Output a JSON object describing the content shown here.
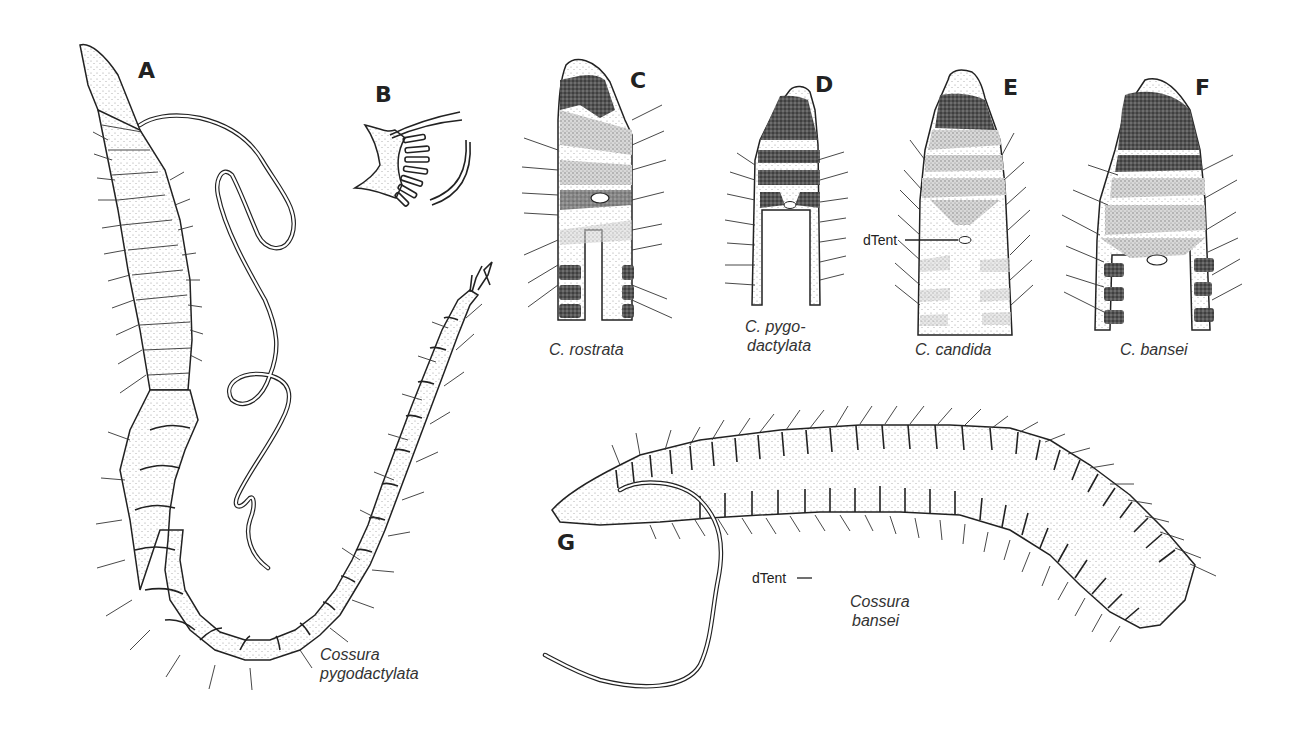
{
  "figure": {
    "panels": [
      {
        "id": "A",
        "label": "A",
        "caption_line1": "Cossura",
        "caption_line2": "pygodactylata",
        "view": "whole worm, dorsal, with dorsal tentacle"
      },
      {
        "id": "B",
        "label": "B",
        "caption": "",
        "view": "pygidium detail with anal cirri"
      },
      {
        "id": "C",
        "label": "C",
        "caption": "C. rostrata",
        "view": "anterior end, dorsal pigmentation"
      },
      {
        "id": "D",
        "label": "D",
        "caption_line1": "C. pygo-",
        "caption_line2": "dactylata",
        "view": "anterior end, dorsal pigmentation"
      },
      {
        "id": "E",
        "label": "E",
        "caption": "C. candida",
        "view": "anterior end, dorsal pigmentation"
      },
      {
        "id": "F",
        "label": "F",
        "caption": "C. bansei",
        "view": "anterior end, dorsal pigmentation"
      },
      {
        "id": "G",
        "label": "G",
        "caption_line1": "Cossura",
        "caption_line2": "bansei",
        "view": "whole worm, lateral, with dorsal tentacle"
      }
    ],
    "callouts": {
      "dtent_E": "dTent",
      "dtent_G": "dTent"
    },
    "colors": {
      "background": "#ffffff",
      "ink": "#222222",
      "caption_text": "#333333"
    }
  }
}
